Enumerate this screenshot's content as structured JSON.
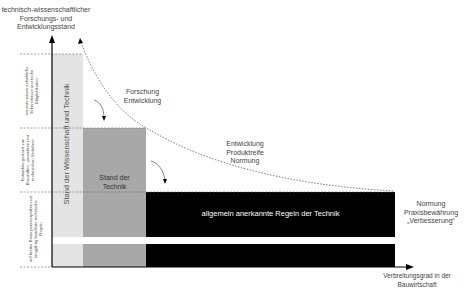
{
  "diagram": {
    "y_axis_label": "technisch-wissenschaftlicher Forschungs- und Entwicklungsstand",
    "y_axis_label_lines": [
      "technisch-wissenschaftlicher",
      "Forschungs- und",
      "Entwicklungsstand"
    ],
    "x_axis_label_lines": [
      "Verbreitungsgrad in der",
      "Bauwirtschaft"
    ],
    "levels": [
      {
        "label": "neueste wissenschaftliche Erkenntnisse und techn. Möglichkeiten"
      },
      {
        "label": "Entwicklungsstand von Baustoffen, -produkten und technischen Verfahren"
      },
      {
        "label": "auf breiter Basis praxiserprobte und langjährig bewährte technische Regeln"
      }
    ],
    "blocks": [
      {
        "label": "Stand der Wissenschaft und Technik",
        "color": "#e3e3e3"
      },
      {
        "label_lines": [
          "Stand der",
          "Technik"
        ],
        "color": "#a9a9a9"
      },
      {
        "label": "allgemein anerkannte Regeln der Technik",
        "color": "#000000"
      }
    ],
    "annotations": {
      "research": [
        "Forschung",
        "Entwicklung"
      ],
      "development": [
        "Entwicklung",
        "Produktreife",
        "Normung"
      ],
      "standardization": [
        "Normung",
        "Praxisbewährung",
        "„Verbesserung“"
      ]
    }
  }
}
